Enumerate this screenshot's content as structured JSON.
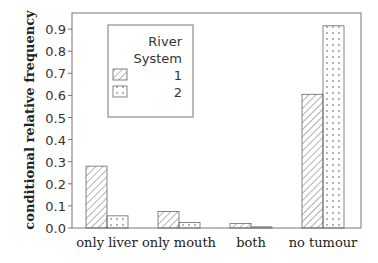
{
  "chart_data": {
    "type": "bar",
    "title": "",
    "xlabel": "",
    "ylabel": "conditional relative frequency",
    "ylim": [
      0,
      0.95
    ],
    "yticks": [
      "0.0",
      "0.1",
      "0.2",
      "0.3",
      "0.4",
      "0.5",
      "0.6",
      "0.7",
      "0.8",
      "0.9"
    ],
    "grid": false,
    "legend_position": "upper-left-inside",
    "legend_title": [
      "River",
      "System"
    ],
    "categories": [
      "only liver",
      "only mouth",
      "both",
      "no tumour"
    ],
    "series": [
      {
        "name": "1",
        "pattern": "diagonal-hatch",
        "values": [
          0.28,
          0.075,
          0.02,
          0.605
        ]
      },
      {
        "name": "2",
        "pattern": "dots",
        "values": [
          0.055,
          0.025,
          0.005,
          0.915
        ]
      }
    ]
  },
  "axis": {
    "tick_labels": [
      "0.0",
      "0.1",
      "0.2",
      "0.3",
      "0.4",
      "0.5",
      "0.6",
      "0.7",
      "0.8",
      "0.9"
    ]
  },
  "legend": {
    "title_line1": "River",
    "title_line2": "System",
    "items": [
      {
        "label": "1"
      },
      {
        "label": "2"
      }
    ]
  },
  "categories": [
    "only liver",
    "only mouth",
    "both",
    "no tumour"
  ],
  "colors": {
    "stroke": "#555555",
    "background": "#ffffff"
  }
}
